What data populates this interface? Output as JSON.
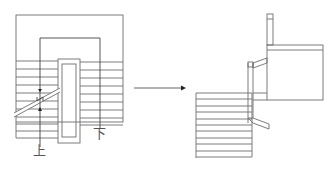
{
  "diagram": {
    "type": "stair-plan-to-section",
    "left_plan": {
      "up_label": "上",
      "down_label": "下",
      "tread_count": 12
    },
    "arrow": {
      "direction": "right"
    },
    "right_section": {
      "tread_count": 10
    },
    "colors": {
      "line": "#6e6e6e",
      "arrow": "#222222",
      "background": "#ffffff"
    }
  }
}
